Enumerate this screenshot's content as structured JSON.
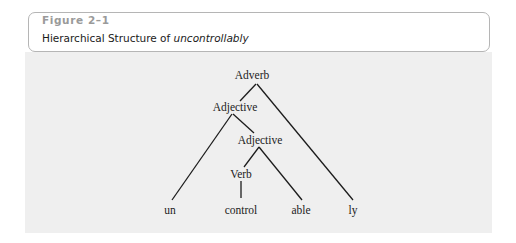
{
  "figure": {
    "label": "Figure 2–1",
    "title_prefix": "Hierarchical Structure of ",
    "title_term": "uncontrollably"
  },
  "tree": {
    "nodes": [
      {
        "id": "adverb",
        "label": "Adverb",
        "x": 252,
        "y": 75
      },
      {
        "id": "adjective-1",
        "label": "Adjective",
        "x": 235,
        "y": 107
      },
      {
        "id": "adjective-2",
        "label": "Adjective",
        "x": 260,
        "y": 140
      },
      {
        "id": "verb",
        "label": "Verb",
        "x": 241,
        "y": 174
      },
      {
        "id": "un",
        "label": "un",
        "x": 170,
        "y": 210
      },
      {
        "id": "control",
        "label": "control",
        "x": 241,
        "y": 210
      },
      {
        "id": "able",
        "label": "able",
        "x": 301,
        "y": 210
      },
      {
        "id": "ly",
        "label": "ly",
        "x": 353,
        "y": 210
      }
    ],
    "edges": [
      {
        "from": "adverb",
        "to": "adjective-1"
      },
      {
        "from": "adverb",
        "to": "ly"
      },
      {
        "from": "adjective-1",
        "to": "un"
      },
      {
        "from": "adjective-1",
        "to": "adjective-2"
      },
      {
        "from": "adjective-2",
        "to": "verb"
      },
      {
        "from": "adjective-2",
        "to": "able"
      },
      {
        "from": "verb",
        "to": "control"
      }
    ]
  },
  "colors": {
    "panel_bg": "#efefef",
    "header_border": "#b5b5b5",
    "label_gray": "#9a9a9a",
    "line": "#1c1c1c"
  }
}
